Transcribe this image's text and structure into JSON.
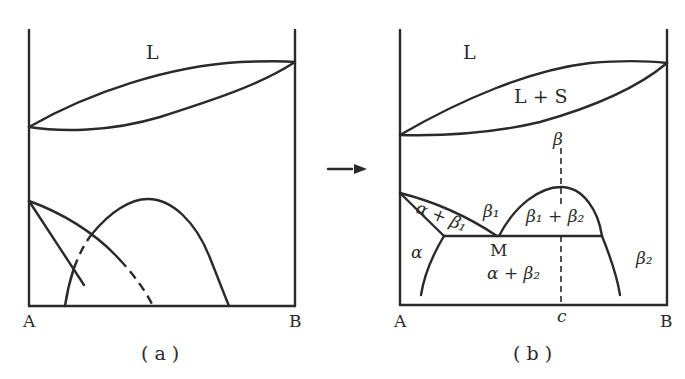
{
  "panel_a": {
    "caption": "( a )",
    "region_labels": {
      "liquid": "L"
    },
    "axis_labels": {
      "left": "A",
      "right": "B"
    }
  },
  "panel_b": {
    "caption": "( b )",
    "region_labels": {
      "liquid": "L",
      "two_phase_ls": "L + S",
      "beta": "β",
      "alpha_beta1": "α + β₁",
      "beta1": "β₁",
      "beta1_beta2": "β₁ + β₂",
      "alpha": "α",
      "point_m": "M",
      "alpha_beta2": "α + β₂",
      "beta2": "β₂"
    },
    "axis_labels": {
      "left": "A",
      "composition_c": "c",
      "right": "B"
    }
  },
  "arrow": {
    "label": ""
  },
  "colors": {
    "line": "#2a2a2a",
    "background": "#ffffff"
  }
}
